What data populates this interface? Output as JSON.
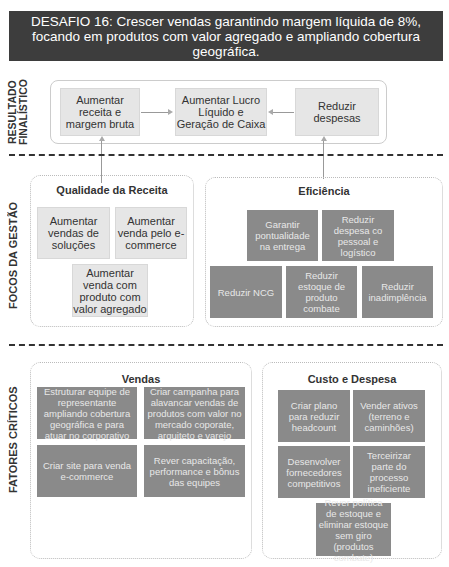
{
  "header": {
    "title": "DESAFIO 16: Crescer vendas garantindo margem líquida de 8%, focando em produtos com valor agregado e ampliando cobertura geográfica."
  },
  "sections": {
    "resultado": {
      "label": "RESULTADO\nFINALÍSTICO"
    },
    "focos": {
      "label": "FOCOS DA GESTÃO"
    },
    "fatores": {
      "label": "FATORES CRÍTICOS"
    }
  },
  "resultado": {
    "boxes": [
      "Aumentar receita e margem bruta",
      "Aumentar Lucro Líquido e Geração de Caixa",
      "Reduzir despesas"
    ]
  },
  "focos": {
    "qualidade": {
      "title": "Qualidade da Receita",
      "items": [
        "Aumentar vendas de soluções",
        "Aumentar venda pelo e-commerce",
        "Aumentar venda com produto com valor agregado"
      ]
    },
    "eficiencia": {
      "title": "Eficiência",
      "items": [
        "Garantir pontualidade na entrega",
        "Reduzir despesa co pessoal e logístico",
        "Reduzir NCG",
        "Reduzir estoque de produto combate",
        "Reduzir inadimplência"
      ]
    }
  },
  "fatores": {
    "vendas": {
      "title": "Vendas",
      "items": [
        "Estruturar equipe de representante ampliando cobertura geográfica e para atuar no corporativo",
        "Criar campanha para alavancar vendas de produtos com valor no mercado coporate, arquiteto e varejo",
        "Criar site para venda e-commerce",
        "Rever capacitação, performance e bônus das equipes"
      ]
    },
    "custo": {
      "title": "Custo e Despesa",
      "items": [
        "Criar plano para reduzir headcount",
        "Vender ativos (terreno e caminhões)",
        "Desenvolver fornecedores competitivos",
        "Terceirizar parte do processo ineficiente",
        "Rever política de estoque e eliminar estoque sem giro (produtos combate)"
      ]
    }
  }
}
